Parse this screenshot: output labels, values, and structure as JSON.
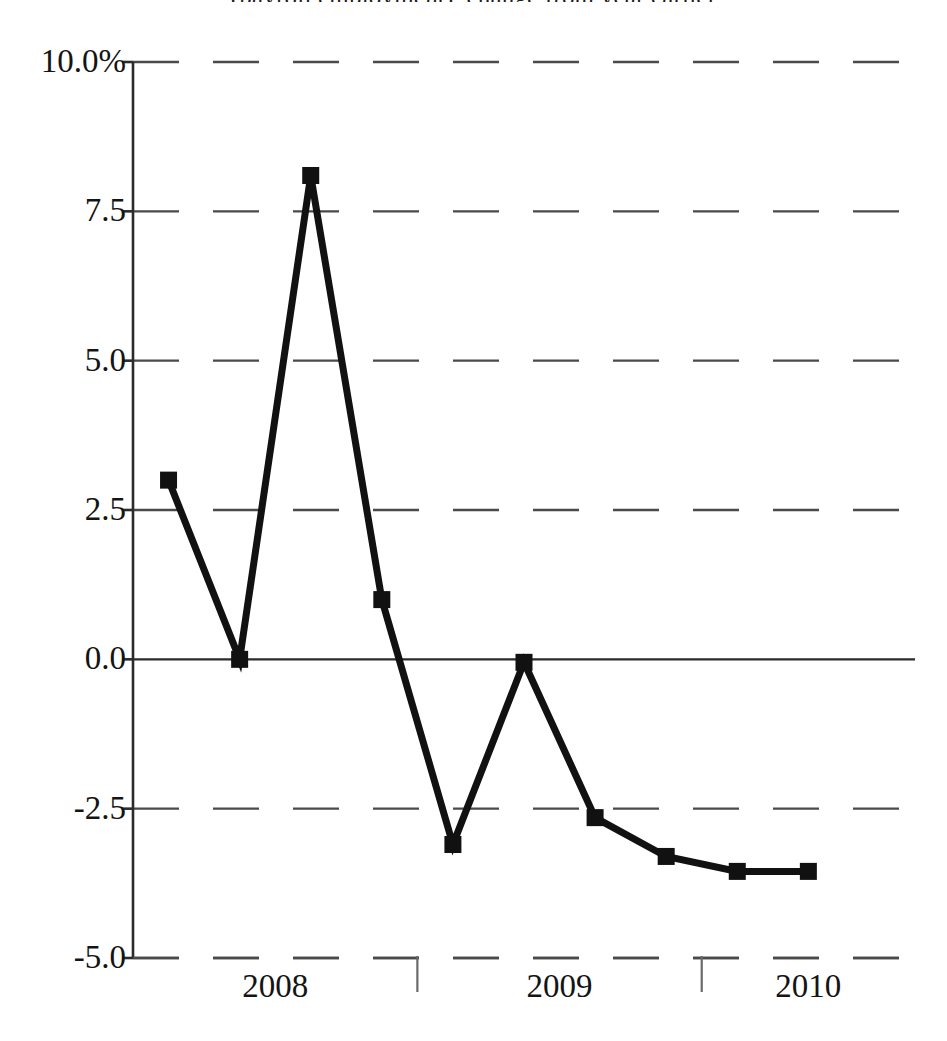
{
  "chart": {
    "title_visible_fragment": "(payroll employment), change from year earlier"
  },
  "axes": {
    "y_unit_suffix": "%",
    "y_ticks": [
      {
        "label": "10.0%",
        "value": 10.0
      },
      {
        "label": "7.5",
        "value": 7.5
      },
      {
        "label": "5.0",
        "value": 5.0
      },
      {
        "label": "2.5",
        "value": 2.5
      },
      {
        "label": "0.0",
        "value": 0.0
      },
      {
        "label": "-2.5",
        "value": -2.5
      },
      {
        "label": "-5.0",
        "value": -5.0
      }
    ],
    "x_ticks": [
      {
        "label": "2008",
        "value": 2008
      },
      {
        "label": "2009",
        "value": 2009
      },
      {
        "label": "2010",
        "value": 2010
      }
    ]
  },
  "style": {
    "line_color": "#111111",
    "marker_color": "#111111",
    "grid_color": "#4a4a4a",
    "axis_color": "#2b2b2b",
    "background": "#ffffff",
    "line_width": 7,
    "marker_size": 17,
    "grid_dash": "dashed"
  },
  "chart_data": {
    "type": "line",
    "xlabel": "",
    "ylabel": "",
    "ylim": [
      -5.0,
      10.0
    ],
    "xlim": [
      2007.875,
      2010.625
    ],
    "grid": true,
    "legend": null,
    "y_tick_values": [
      10.0,
      7.5,
      5.0,
      2.5,
      0.0,
      -2.5,
      -5.0
    ],
    "y_tick_labels": [
      "10.0%",
      "7.5",
      "5.0",
      "2.5",
      "0.0",
      "-2.5",
      "-5.0"
    ],
    "x_tick_values": [
      2008,
      2009,
      2010
    ],
    "x_tick_labels": [
      "2008",
      "2009",
      "2010"
    ],
    "x": [
      2008.0,
      2008.25,
      2008.5,
      2008.75,
      2009.0,
      2009.25,
      2009.5,
      2009.75,
      2010.0,
      2010.25
    ],
    "x_period_labels": [
      "2008 Q1",
      "2008 Q2",
      "2008 Q3",
      "2008 Q4",
      "2009 Q1",
      "2009 Q2",
      "2009 Q3",
      "2009 Q4",
      "2010 Q1",
      "2010 Q2"
    ],
    "values": [
      3.0,
      0.0,
      8.1,
      1.0,
      -3.1,
      -0.05,
      -2.65,
      -3.3,
      -3.55,
      -3.55
    ],
    "series": [
      {
        "name": "percent change from year earlier",
        "values": [
          3.0,
          0.0,
          8.1,
          1.0,
          -3.1,
          -0.05,
          -2.65,
          -3.3,
          -3.55,
          -3.55
        ],
        "marker": "square",
        "color": "#111111"
      }
    ]
  }
}
